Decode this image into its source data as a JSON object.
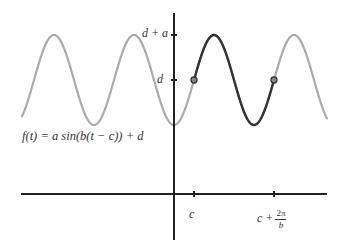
{
  "diagram": {
    "formula": "f(t) = a sin(b(t − c)) + d",
    "formula_parts": {
      "lhs": "f(t)",
      "eq": "=",
      "rhs": "a sin(b(t − c)) + d"
    },
    "y_axis": {
      "ticks": [
        {
          "label": "d + a",
          "role": "maximum"
        },
        {
          "label": "d",
          "role": "midline"
        }
      ]
    },
    "x_axis": {
      "ticks": [
        {
          "label": "c",
          "role": "start-of-period"
        },
        {
          "label_main": "c +",
          "frac_num": "2π",
          "frac_den": "b",
          "role": "end-of-period"
        }
      ]
    },
    "colors": {
      "curve_light": "#aaaaaa",
      "curve_highlight": "#333333",
      "axes": "#222222",
      "marker_fill": "#888888",
      "marker_stroke": "#333333",
      "text": "#333333"
    },
    "highlighted_period": {
      "from": "c",
      "to": "c + 2π/b"
    },
    "markers": [
      {
        "at": "c",
        "value": "d"
      },
      {
        "at": "c + 2π/b",
        "value": "d"
      }
    ]
  },
  "labels": {
    "y_max": "d + a",
    "y_mid": "d",
    "x_c": "c",
    "x_c_plus_main": "c +",
    "x_frac_num": "2π",
    "x_frac_den": "b",
    "formula": "f(t) = a sin(b(t − c)) + d"
  }
}
